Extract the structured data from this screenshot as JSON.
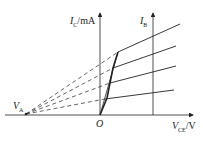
{
  "diagram": {
    "y_axis": {
      "symbol": "I",
      "sub": "C",
      "unit": "/mA"
    },
    "x_axis": {
      "symbol": "V",
      "sub": "CE",
      "unit": "/V"
    },
    "ib_axis": {
      "symbol": "I",
      "sub": "B"
    },
    "origin": "O",
    "early_point": {
      "symbol": "V",
      "sub": "A"
    },
    "colors": {
      "line": "#222222",
      "background": "#ffffff"
    }
  }
}
